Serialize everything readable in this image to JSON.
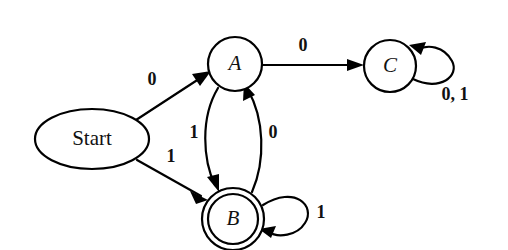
{
  "diagram": {
    "type": "state-transition-diagram",
    "background_color": "#ffffff",
    "stroke_color": "#000000",
    "text_color": "#111111"
  },
  "nodes": {
    "start": {
      "label": "Start",
      "shape": "ellipse",
      "cx": 92,
      "cy": 139,
      "rx": 57,
      "ry": 30,
      "accepting": false
    },
    "a": {
      "label": "A",
      "shape": "circle",
      "cx": 235,
      "cy": 64,
      "r": 27,
      "accepting": false
    },
    "b": {
      "label": "B",
      "shape": "double-circle",
      "cx": 233,
      "cy": 219,
      "r": 31,
      "r_inner": 25,
      "accepting": true
    },
    "c": {
      "label": "C",
      "shape": "circle",
      "cx": 390,
      "cy": 66,
      "r": 26,
      "accepting": false
    }
  },
  "edges": [
    {
      "id": "start-to-a",
      "from": "start",
      "to": "a",
      "label": "0",
      "label_x": 152,
      "label_y": 81,
      "kind": "straight"
    },
    {
      "id": "start-to-b",
      "from": "start",
      "to": "b",
      "label": "1",
      "label_x": 171,
      "label_y": 158,
      "kind": "straight"
    },
    {
      "id": "a-to-b",
      "from": "a",
      "to": "b",
      "label": "1",
      "label_x": 194,
      "label_y": 134,
      "kind": "curve-left"
    },
    {
      "id": "b-to-a",
      "from": "b",
      "to": "a",
      "label": "0",
      "label_x": 273,
      "label_y": 134,
      "kind": "curve-right"
    },
    {
      "id": "a-to-c",
      "from": "a",
      "to": "c",
      "label": "0",
      "label_x": 303,
      "label_y": 47,
      "kind": "straight"
    },
    {
      "id": "b-to-b",
      "from": "b",
      "to": "b",
      "label": "1",
      "label_x": 321,
      "label_y": 214,
      "kind": "self-loop"
    },
    {
      "id": "c-to-c",
      "from": "c",
      "to": "c",
      "label": "0, 1",
      "label_x": 455,
      "label_y": 96,
      "kind": "self-loop"
    }
  ]
}
